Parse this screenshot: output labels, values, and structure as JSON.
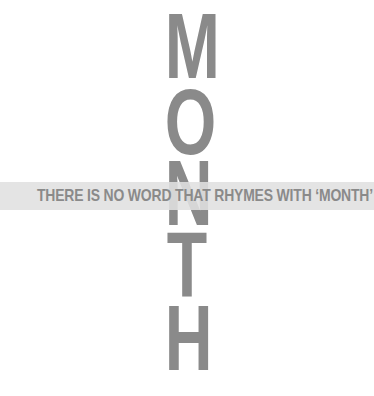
{
  "vertical_word": {
    "letters": [
      "M",
      "O",
      "N",
      "T",
      "H"
    ],
    "color": "#8a8a8a"
  },
  "band": {
    "text": "THERE IS NO WORD THAT RHYMES WITH ‘MONTH’",
    "background": "#e0e0e0",
    "text_color": "#8a8a8a"
  }
}
